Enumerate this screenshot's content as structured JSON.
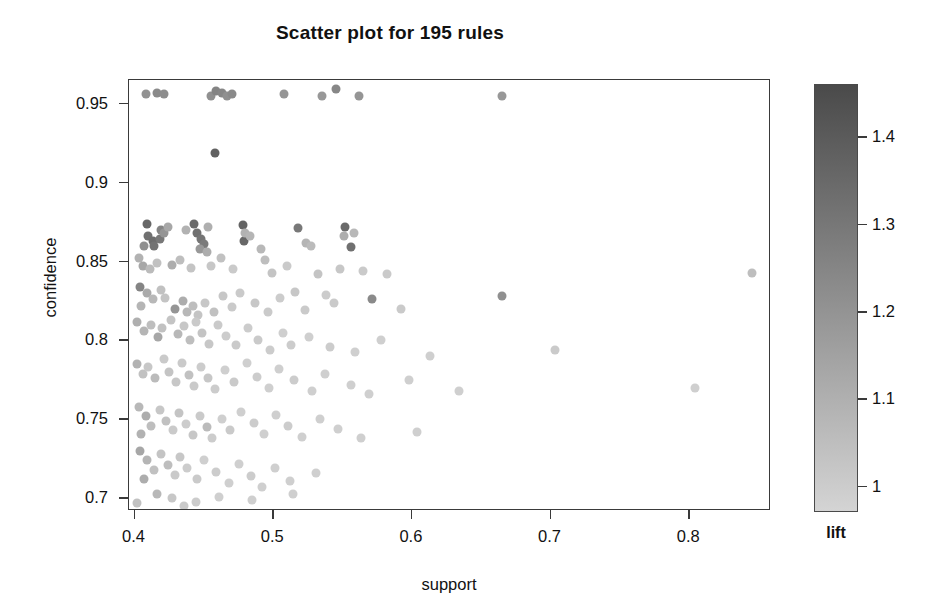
{
  "title": "Scatter plot for 195 rules",
  "axes": {
    "xlabel": "support",
    "ylabel": "confidence",
    "xticks": [
      "0.4",
      "0.5",
      "0.6",
      "0.7",
      "0.8"
    ],
    "yticks": [
      "0.95",
      "0.9",
      "0.85",
      "0.8",
      "0.75",
      "0.7"
    ]
  },
  "colorbar": {
    "label": "lift",
    "ticks": [
      "1.4",
      "1.3",
      "1.2",
      "1.1",
      "1"
    ],
    "top_color": "#4a4a4a",
    "bottom_color": "#d4d4d4"
  },
  "chart_data": {
    "type": "scatter",
    "title": "Scatter plot for 195 rules",
    "xlabel": "support",
    "ylabel": "confidence",
    "colorbar_label": "lift",
    "xlim": [
      0.396,
      0.859
    ],
    "ylim": [
      0.692,
      0.965
    ],
    "clim": [
      0.97,
      1.46
    ],
    "xticks": [
      0.4,
      0.5,
      0.6,
      0.7,
      0.8
    ],
    "yticks": [
      0.7,
      0.75,
      0.8,
      0.85,
      0.9,
      0.95
    ],
    "cticks": [
      1.0,
      1.1,
      1.2,
      1.3,
      1.4
    ],
    "grid": false,
    "legend": "colorbar-right",
    "n_points": 195,
    "marker": "circle",
    "marker_size_px": 9,
    "colormap": "grayscale-dark-high",
    "points": [
      {
        "x": 0.408,
        "y": 0.956,
        "lift": 1.21
      },
      {
        "x": 0.416,
        "y": 0.957,
        "lift": 1.24
      },
      {
        "x": 0.421,
        "y": 0.956,
        "lift": 1.23
      },
      {
        "x": 0.455,
        "y": 0.955,
        "lift": 1.22
      },
      {
        "x": 0.459,
        "y": 0.958,
        "lift": 1.26
      },
      {
        "x": 0.463,
        "y": 0.957,
        "lift": 1.25
      },
      {
        "x": 0.467,
        "y": 0.955,
        "lift": 1.22
      },
      {
        "x": 0.47,
        "y": 0.956,
        "lift": 1.24
      },
      {
        "x": 0.508,
        "y": 0.956,
        "lift": 1.2
      },
      {
        "x": 0.535,
        "y": 0.955,
        "lift": 1.19
      },
      {
        "x": 0.545,
        "y": 0.959,
        "lift": 1.25
      },
      {
        "x": 0.562,
        "y": 0.955,
        "lift": 1.2
      },
      {
        "x": 0.665,
        "y": 0.955,
        "lift": 1.19
      },
      {
        "x": 0.458,
        "y": 0.919,
        "lift": 1.38
      },
      {
        "x": 0.409,
        "y": 0.874,
        "lift": 1.36
      },
      {
        "x": 0.41,
        "y": 0.866,
        "lift": 1.33
      },
      {
        "x": 0.413,
        "y": 0.863,
        "lift": 1.34
      },
      {
        "x": 0.414,
        "y": 0.86,
        "lift": 1.32
      },
      {
        "x": 0.418,
        "y": 0.864,
        "lift": 1.3
      },
      {
        "x": 0.419,
        "y": 0.87,
        "lift": 1.26
      },
      {
        "x": 0.421,
        "y": 0.868,
        "lift": 1.2
      },
      {
        "x": 0.407,
        "y": 0.86,
        "lift": 1.22
      },
      {
        "x": 0.424,
        "y": 0.872,
        "lift": 1.14
      },
      {
        "x": 0.437,
        "y": 0.87,
        "lift": 1.1
      },
      {
        "x": 0.443,
        "y": 0.874,
        "lift": 1.35
      },
      {
        "x": 0.445,
        "y": 0.868,
        "lift": 1.33
      },
      {
        "x": 0.448,
        "y": 0.864,
        "lift": 1.31
      },
      {
        "x": 0.45,
        "y": 0.861,
        "lift": 1.29
      },
      {
        "x": 0.447,
        "y": 0.858,
        "lift": 1.19
      },
      {
        "x": 0.452,
        "y": 0.856,
        "lift": 1.12
      },
      {
        "x": 0.453,
        "y": 0.872,
        "lift": 1.11
      },
      {
        "x": 0.478,
        "y": 0.873,
        "lift": 1.37
      },
      {
        "x": 0.479,
        "y": 0.863,
        "lift": 1.36
      },
      {
        "x": 0.48,
        "y": 0.868,
        "lift": 1.1
      },
      {
        "x": 0.483,
        "y": 0.866,
        "lift": 1.09
      },
      {
        "x": 0.491,
        "y": 0.858,
        "lift": 1.08
      },
      {
        "x": 0.518,
        "y": 0.871,
        "lift": 1.3
      },
      {
        "x": 0.524,
        "y": 0.862,
        "lift": 1.09
      },
      {
        "x": 0.527,
        "y": 0.86,
        "lift": 1.07
      },
      {
        "x": 0.552,
        "y": 0.872,
        "lift": 1.35
      },
      {
        "x": 0.556,
        "y": 0.859,
        "lift": 1.33
      },
      {
        "x": 0.551,
        "y": 0.866,
        "lift": 1.12
      },
      {
        "x": 0.558,
        "y": 0.868,
        "lift": 1.08
      },
      {
        "x": 0.403,
        "y": 0.852,
        "lift": 1.1
      },
      {
        "x": 0.406,
        "y": 0.847,
        "lift": 1.14
      },
      {
        "x": 0.411,
        "y": 0.845,
        "lift": 1.07
      },
      {
        "x": 0.416,
        "y": 0.849,
        "lift": 1.05
      },
      {
        "x": 0.427,
        "y": 0.848,
        "lift": 1.12
      },
      {
        "x": 0.433,
        "y": 0.851,
        "lift": 1.06
      },
      {
        "x": 0.441,
        "y": 0.846,
        "lift": 1.04
      },
      {
        "x": 0.455,
        "y": 0.847,
        "lift": 1.03
      },
      {
        "x": 0.462,
        "y": 0.852,
        "lift": 1.05
      },
      {
        "x": 0.471,
        "y": 0.845,
        "lift": 1.02
      },
      {
        "x": 0.494,
        "y": 0.851,
        "lift": 1.06
      },
      {
        "x": 0.499,
        "y": 0.843,
        "lift": 1.04
      },
      {
        "x": 0.51,
        "y": 0.847,
        "lift": 1.02
      },
      {
        "x": 0.532,
        "y": 0.842,
        "lift": 1.04
      },
      {
        "x": 0.548,
        "y": 0.845,
        "lift": 1.03
      },
      {
        "x": 0.565,
        "y": 0.844,
        "lift": 1.02
      },
      {
        "x": 0.582,
        "y": 0.842,
        "lift": 1.02
      },
      {
        "x": 0.845,
        "y": 0.843,
        "lift": 1.06
      },
      {
        "x": 0.404,
        "y": 0.834,
        "lift": 1.26
      },
      {
        "x": 0.409,
        "y": 0.83,
        "lift": 1.13
      },
      {
        "x": 0.413,
        "y": 0.826,
        "lift": 1.08
      },
      {
        "x": 0.405,
        "y": 0.822,
        "lift": 1.09
      },
      {
        "x": 0.419,
        "y": 0.832,
        "lift": 1.05
      },
      {
        "x": 0.422,
        "y": 0.827,
        "lift": 1.04
      },
      {
        "x": 0.429,
        "y": 0.82,
        "lift": 1.2
      },
      {
        "x": 0.435,
        "y": 0.825,
        "lift": 1.12
      },
      {
        "x": 0.438,
        "y": 0.818,
        "lift": 1.08
      },
      {
        "x": 0.442,
        "y": 0.822,
        "lift": 1.06
      },
      {
        "x": 0.446,
        "y": 0.816,
        "lift": 1.04
      },
      {
        "x": 0.451,
        "y": 0.824,
        "lift": 1.03
      },
      {
        "x": 0.457,
        "y": 0.818,
        "lift": 1.05
      },
      {
        "x": 0.464,
        "y": 0.828,
        "lift": 1.03
      },
      {
        "x": 0.47,
        "y": 0.821,
        "lift": 1.02
      },
      {
        "x": 0.476,
        "y": 0.83,
        "lift": 1.02
      },
      {
        "x": 0.487,
        "y": 0.824,
        "lift": 1.03
      },
      {
        "x": 0.496,
        "y": 0.818,
        "lift": 1.02
      },
      {
        "x": 0.505,
        "y": 0.827,
        "lift": 1.01
      },
      {
        "x": 0.516,
        "y": 0.831,
        "lift": 1.03
      },
      {
        "x": 0.523,
        "y": 0.819,
        "lift": 1.02
      },
      {
        "x": 0.538,
        "y": 0.829,
        "lift": 1.01
      },
      {
        "x": 0.544,
        "y": 0.824,
        "lift": 1.02
      },
      {
        "x": 0.571,
        "y": 0.826,
        "lift": 1.24
      },
      {
        "x": 0.592,
        "y": 0.82,
        "lift": 1.02
      },
      {
        "x": 0.665,
        "y": 0.828,
        "lift": 1.22
      },
      {
        "x": 0.402,
        "y": 0.812,
        "lift": 1.11
      },
      {
        "x": 0.407,
        "y": 0.806,
        "lift": 1.09
      },
      {
        "x": 0.412,
        "y": 0.81,
        "lift": 1.06
      },
      {
        "x": 0.417,
        "y": 0.802,
        "lift": 1.14
      },
      {
        "x": 0.42,
        "y": 0.808,
        "lift": 1.05
      },
      {
        "x": 0.426,
        "y": 0.813,
        "lift": 1.04
      },
      {
        "x": 0.431,
        "y": 0.804,
        "lift": 1.08
      },
      {
        "x": 0.436,
        "y": 0.809,
        "lift": 1.03
      },
      {
        "x": 0.44,
        "y": 0.8,
        "lift": 1.06
      },
      {
        "x": 0.444,
        "y": 0.812,
        "lift": 1.02
      },
      {
        "x": 0.449,
        "y": 0.805,
        "lift": 1.04
      },
      {
        "x": 0.454,
        "y": 0.798,
        "lift": 1.03
      },
      {
        "x": 0.46,
        "y": 0.81,
        "lift": 1.02
      },
      {
        "x": 0.466,
        "y": 0.803,
        "lift": 1.01
      },
      {
        "x": 0.473,
        "y": 0.797,
        "lift": 1.02
      },
      {
        "x": 0.482,
        "y": 0.808,
        "lift": 1.01
      },
      {
        "x": 0.489,
        "y": 0.8,
        "lift": 1.02
      },
      {
        "x": 0.498,
        "y": 0.794,
        "lift": 1.01
      },
      {
        "x": 0.507,
        "y": 0.805,
        "lift": 1.0
      },
      {
        "x": 0.513,
        "y": 0.797,
        "lift": 1.01
      },
      {
        "x": 0.526,
        "y": 0.802,
        "lift": 1.0
      },
      {
        "x": 0.541,
        "y": 0.796,
        "lift": 1.01
      },
      {
        "x": 0.559,
        "y": 0.793,
        "lift": 1.0
      },
      {
        "x": 0.578,
        "y": 0.8,
        "lift": 1.0
      },
      {
        "x": 0.613,
        "y": 0.79,
        "lift": 1.0
      },
      {
        "x": 0.703,
        "y": 0.794,
        "lift": 1.02
      },
      {
        "x": 0.402,
        "y": 0.785,
        "lift": 1.1
      },
      {
        "x": 0.406,
        "y": 0.779,
        "lift": 1.05
      },
      {
        "x": 0.41,
        "y": 0.783,
        "lift": 1.03
      },
      {
        "x": 0.415,
        "y": 0.776,
        "lift": 1.07
      },
      {
        "x": 0.421,
        "y": 0.788,
        "lift": 1.02
      },
      {
        "x": 0.425,
        "y": 0.78,
        "lift": 1.04
      },
      {
        "x": 0.43,
        "y": 0.774,
        "lift": 1.03
      },
      {
        "x": 0.434,
        "y": 0.786,
        "lift": 1.02
      },
      {
        "x": 0.439,
        "y": 0.778,
        "lift": 1.05
      },
      {
        "x": 0.443,
        "y": 0.771,
        "lift": 1.02
      },
      {
        "x": 0.448,
        "y": 0.783,
        "lift": 1.01
      },
      {
        "x": 0.453,
        "y": 0.776,
        "lift": 1.03
      },
      {
        "x": 0.458,
        "y": 0.769,
        "lift": 1.01
      },
      {
        "x": 0.465,
        "y": 0.781,
        "lift": 1.0
      },
      {
        "x": 0.472,
        "y": 0.774,
        "lift": 1.02
      },
      {
        "x": 0.481,
        "y": 0.786,
        "lift": 1.0
      },
      {
        "x": 0.488,
        "y": 0.777,
        "lift": 1.01
      },
      {
        "x": 0.497,
        "y": 0.77,
        "lift": 1.0
      },
      {
        "x": 0.504,
        "y": 0.782,
        "lift": 1.0
      },
      {
        "x": 0.515,
        "y": 0.775,
        "lift": 1.01
      },
      {
        "x": 0.528,
        "y": 0.768,
        "lift": 1.0
      },
      {
        "x": 0.537,
        "y": 0.779,
        "lift": 1.0
      },
      {
        "x": 0.556,
        "y": 0.772,
        "lift": 1.0
      },
      {
        "x": 0.569,
        "y": 0.766,
        "lift": 1.0
      },
      {
        "x": 0.598,
        "y": 0.775,
        "lift": 1.0
      },
      {
        "x": 0.634,
        "y": 0.768,
        "lift": 1.0
      },
      {
        "x": 0.804,
        "y": 0.77,
        "lift": 1.0
      },
      {
        "x": 0.403,
        "y": 0.758,
        "lift": 1.08
      },
      {
        "x": 0.408,
        "y": 0.752,
        "lift": 1.12
      },
      {
        "x": 0.412,
        "y": 0.746,
        "lift": 1.06
      },
      {
        "x": 0.405,
        "y": 0.741,
        "lift": 1.1
      },
      {
        "x": 0.418,
        "y": 0.756,
        "lift": 1.03
      },
      {
        "x": 0.423,
        "y": 0.749,
        "lift": 1.05
      },
      {
        "x": 0.428,
        "y": 0.743,
        "lift": 1.02
      },
      {
        "x": 0.432,
        "y": 0.754,
        "lift": 1.04
      },
      {
        "x": 0.437,
        "y": 0.747,
        "lift": 1.01
      },
      {
        "x": 0.442,
        "y": 0.74,
        "lift": 1.03
      },
      {
        "x": 0.447,
        "y": 0.752,
        "lift": 1.02
      },
      {
        "x": 0.452,
        "y": 0.745,
        "lift": 1.07
      },
      {
        "x": 0.456,
        "y": 0.738,
        "lift": 1.01
      },
      {
        "x": 0.463,
        "y": 0.75,
        "lift": 1.0
      },
      {
        "x": 0.469,
        "y": 0.743,
        "lift": 1.02
      },
      {
        "x": 0.477,
        "y": 0.755,
        "lift": 1.0
      },
      {
        "x": 0.486,
        "y": 0.748,
        "lift": 1.01
      },
      {
        "x": 0.493,
        "y": 0.741,
        "lift": 1.0
      },
      {
        "x": 0.502,
        "y": 0.753,
        "lift": 1.0
      },
      {
        "x": 0.511,
        "y": 0.746,
        "lift": 1.01
      },
      {
        "x": 0.521,
        "y": 0.739,
        "lift": 1.0
      },
      {
        "x": 0.534,
        "y": 0.75,
        "lift": 1.0
      },
      {
        "x": 0.547,
        "y": 0.744,
        "lift": 1.0
      },
      {
        "x": 0.563,
        "y": 0.738,
        "lift": 1.0
      },
      {
        "x": 0.604,
        "y": 0.742,
        "lift": 1.0
      },
      {
        "x": 0.404,
        "y": 0.73,
        "lift": 1.14
      },
      {
        "x": 0.409,
        "y": 0.724,
        "lift": 1.09
      },
      {
        "x": 0.414,
        "y": 0.718,
        "lift": 1.05
      },
      {
        "x": 0.407,
        "y": 0.712,
        "lift": 1.12
      },
      {
        "x": 0.419,
        "y": 0.728,
        "lift": 1.04
      },
      {
        "x": 0.424,
        "y": 0.721,
        "lift": 1.06
      },
      {
        "x": 0.429,
        "y": 0.715,
        "lift": 1.02
      },
      {
        "x": 0.433,
        "y": 0.726,
        "lift": 1.03
      },
      {
        "x": 0.438,
        "y": 0.719,
        "lift": 1.01
      },
      {
        "x": 0.445,
        "y": 0.712,
        "lift": 1.02
      },
      {
        "x": 0.45,
        "y": 0.724,
        "lift": 1.0
      },
      {
        "x": 0.459,
        "y": 0.717,
        "lift": 1.01
      },
      {
        "x": 0.468,
        "y": 0.71,
        "lift": 1.0
      },
      {
        "x": 0.475,
        "y": 0.722,
        "lift": 1.0
      },
      {
        "x": 0.484,
        "y": 0.714,
        "lift": 1.01
      },
      {
        "x": 0.492,
        "y": 0.707,
        "lift": 1.0
      },
      {
        "x": 0.501,
        "y": 0.719,
        "lift": 1.0
      },
      {
        "x": 0.512,
        "y": 0.711,
        "lift": 1.0
      },
      {
        "x": 0.531,
        "y": 0.716,
        "lift": 1.0
      },
      {
        "x": 0.416,
        "y": 0.703,
        "lift": 1.08
      },
      {
        "x": 0.427,
        "y": 0.7,
        "lift": 1.03
      },
      {
        "x": 0.444,
        "y": 0.698,
        "lift": 1.01
      },
      {
        "x": 0.461,
        "y": 0.701,
        "lift": 1.0
      },
      {
        "x": 0.485,
        "y": 0.699,
        "lift": 1.0
      },
      {
        "x": 0.514,
        "y": 0.703,
        "lift": 1.0
      },
      {
        "x": 0.402,
        "y": 0.697,
        "lift": 1.05
      },
      {
        "x": 0.436,
        "y": 0.695,
        "lift": 1.02
      }
    ]
  }
}
